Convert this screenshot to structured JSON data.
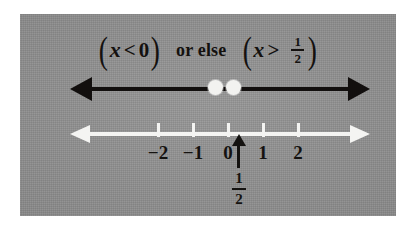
{
  "figure": {
    "kind": "number-line-inequality-diagram",
    "background_color": "#ffffff",
    "panel_color": "#8e8e8e",
    "ink_color": "#141210",
    "highlight_color": "#f4f4f2"
  },
  "statement": {
    "left_expression": {
      "open_paren": "(",
      "variable": "x",
      "relation": "<",
      "value": "0",
      "close_paren": ")"
    },
    "connector": "or else",
    "right_expression": {
      "open_paren": "(",
      "variable": "x",
      "relation": ">",
      "value_numerator": "1",
      "value_denominator": "2",
      "close_paren": ")"
    },
    "plain_text": "(x < 0) or else (x > 1/2)"
  },
  "solution_line": {
    "name": "solution-ray-line",
    "color": "#120f0e",
    "left_arrow": "arrow-left",
    "right_arrow": "arrow-right",
    "endpoints": [
      {
        "label": "0",
        "type": "open-circle",
        "value": 0
      },
      {
        "label": "1/2",
        "type": "open-circle",
        "value": 0.5
      }
    ],
    "rays": [
      {
        "direction": "left",
        "from": 0,
        "description": "x < 0"
      },
      {
        "direction": "right",
        "from": 0.5,
        "description": "x > 1/2"
      }
    ]
  },
  "number_line": {
    "name": "number-line-axis",
    "color": "#f4f4f2",
    "left_arrow": "arrow-left",
    "right_arrow": "arrow-right",
    "ticks": [
      {
        "label": "−2",
        "value": -2
      },
      {
        "label": "−1",
        "value": -1
      },
      {
        "label": "0",
        "value": 0
      },
      {
        "label": "1",
        "value": 1
      },
      {
        "label": "2",
        "value": 2
      }
    ],
    "range": [
      -2,
      2
    ]
  },
  "half_marker": {
    "name": "one-half-pointer",
    "icon": "arrow-up-icon",
    "numerator": "1",
    "denominator": "2",
    "label": "1/2",
    "value": 0.5
  }
}
